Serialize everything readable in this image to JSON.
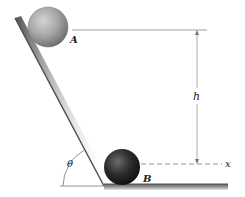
{
  "diagram": {
    "type": "physics-incline",
    "labels": {
      "point_a": "A",
      "point_b": "B",
      "height": "h",
      "axis": "x",
      "angle": "θ"
    },
    "ball_a": {
      "label": "A",
      "color": "#9a9a9a",
      "cx": 48,
      "cy": 27,
      "r": 20
    },
    "ball_b": {
      "label": "B",
      "color": "#2a2a2a",
      "cx": 122,
      "cy": 167,
      "r": 19
    },
    "colors": {
      "incline": "#555555",
      "floor": "#777777",
      "guide_lines": "#888888",
      "text": "#222222"
    }
  }
}
